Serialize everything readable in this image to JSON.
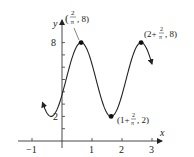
{
  "chart_data": {
    "type": "line",
    "title": "",
    "xlabel": "x",
    "ylabel": "y",
    "function": "y = 5 + 3 sin(pi*x + pi/2 - 2)",
    "xlim": [
      -1.2,
      3.3
    ],
    "ylim": [
      0,
      9.5
    ],
    "x_ticks": [
      -1,
      1,
      2,
      3
    ],
    "x_tick_labels": [
      "−1",
      "1",
      "2",
      "3"
    ],
    "y_ticks": [
      1,
      2,
      3,
      4,
      5,
      6,
      7,
      8
    ],
    "y_tick_labels": [
      "2",
      "8"
    ],
    "grid": false,
    "series": [
      {
        "name": "curve",
        "x_range": [
          -0.62,
          3.0
        ]
      }
    ],
    "annotations": [
      {
        "label": "(2/π, 8)",
        "x": 0.6366,
        "y": 8
      },
      {
        "label": "(1 + 2/π, 2)",
        "x": 1.6366,
        "y": 2
      },
      {
        "label": "(2 + 2/π, 8)",
        "x": 2.6366,
        "y": 8
      }
    ]
  },
  "labels": {
    "x_axis": "x",
    "y_axis": "y",
    "tick_m1": "−1",
    "tick_1": "1",
    "tick_2": "2",
    "tick_3": "3",
    "tick_y2": "2",
    "tick_y8": "8"
  }
}
